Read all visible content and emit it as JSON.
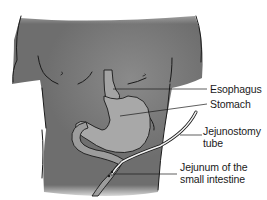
{
  "diagram": {
    "colors": {
      "body": "#6e6e6e",
      "body_highlight": "#858585",
      "stomach": "#a8a8a8",
      "outline": "#1a1a1a",
      "tube": "#f2f2f2",
      "background": "#ffffff"
    },
    "labels": [
      {
        "id": "esophagus",
        "text": "Esophagus"
      },
      {
        "id": "stomach",
        "text": "Stomach"
      },
      {
        "id": "jejunostomy_line1",
        "text": "Jejunostomy"
      },
      {
        "id": "jejunostomy_line2",
        "text": "tube"
      },
      {
        "id": "jejunum_line1",
        "text": "Jejunum of the"
      },
      {
        "id": "jejunum_line2",
        "text": "small intestine"
      }
    ]
  }
}
